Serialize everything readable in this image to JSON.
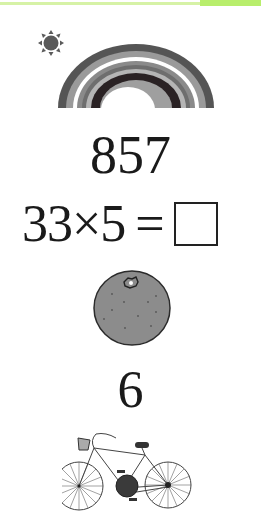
{
  "header": {
    "accent_color": "#b8ee6c",
    "line_color": "#d6f2a6"
  },
  "illustrations": {
    "sun": {
      "icon": "sun-icon",
      "color": "#5a5a5a"
    },
    "rainbow": {
      "icon": "rainbow-icon",
      "band_colors": [
        "#555555",
        "#9a9a9a",
        "#ffffff",
        "#8a8a8a",
        "#b5b5b5",
        "#2a2224",
        "#9f9f9f"
      ]
    },
    "orange": {
      "icon": "orange-icon",
      "fill": "#8c8c8c"
    },
    "bicycle": {
      "icon": "bicycle-icon"
    }
  },
  "content": {
    "number_1": "857",
    "equation": {
      "left": "33×5",
      "operator": "=",
      "answer": ""
    },
    "number_2": "6"
  }
}
